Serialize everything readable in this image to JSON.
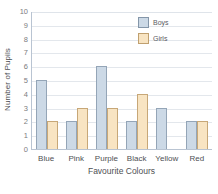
{
  "chart_data": {
    "type": "bar",
    "title": "",
    "xlabel": "Favourite Colours",
    "ylabel": "Number of Pupils",
    "categories": [
      "Blue",
      "Pink",
      "Purple",
      "Black",
      "Yellow",
      "Red"
    ],
    "series": [
      {
        "name": "Boys",
        "color": "#ccd9e6",
        "border": "#94a5b7",
        "values": [
          5,
          2,
          6,
          2,
          3,
          2
        ]
      },
      {
        "name": "Girls",
        "color": "#f8e4c2",
        "border": "#c7a777",
        "values": [
          2,
          3,
          3,
          4,
          0,
          2
        ]
      }
    ],
    "ylim": [
      0,
      10
    ],
    "ytick_step": 1,
    "yticks": [
      "10",
      "9",
      "8",
      "7",
      "6",
      "5",
      "4",
      "3",
      "2",
      "1",
      "0"
    ],
    "grid": true,
    "grid_axis": "y",
    "legend_position": "top-right"
  },
  "axes": {
    "y_title": "Number of Pupils",
    "x_title": "Favourite Colours"
  },
  "legend": {
    "entries": [
      {
        "label": "Boys"
      },
      {
        "label": "Girls"
      }
    ]
  },
  "colors": {
    "boys_fill": "#ccd9e6",
    "boys_stroke": "#94a5b7",
    "girls_fill": "#f8e4c2",
    "girls_stroke": "#c7a777",
    "gridline": "#e3e7ec",
    "axis": "#b9c4d2",
    "text": "#4e4f53",
    "background": "#ffffff"
  }
}
